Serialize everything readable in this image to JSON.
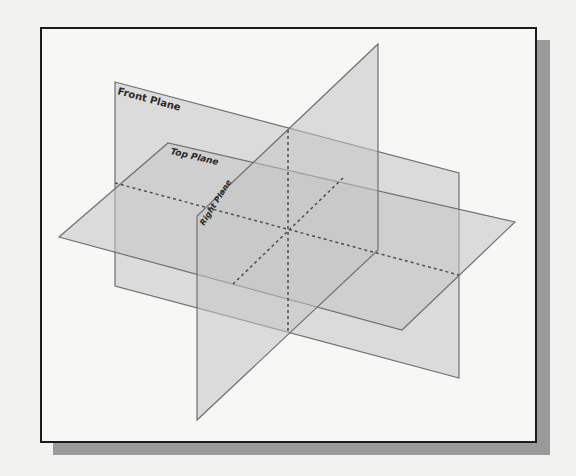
{
  "figure": {
    "type": "datum-planes-isometric",
    "labels": {
      "front_plane": "Front Plane",
      "top_plane": "Top Plane",
      "right_plane": "Right Plane"
    },
    "colors": {
      "plane_fill": "#c8c8c8",
      "plane_edge": "#6e6e6e",
      "dashed_line": "#555555",
      "frame_border": "#1c1c1c",
      "shadow": "#9a9a9a"
    }
  }
}
